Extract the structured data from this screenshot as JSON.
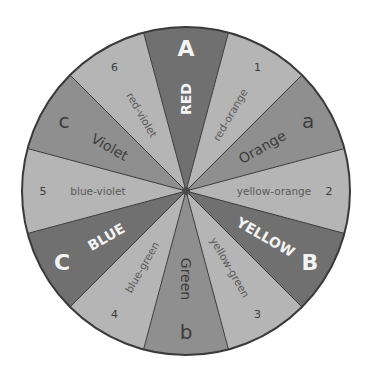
{
  "diagram": {
    "center": [
      186,
      191
    ],
    "radius": 164,
    "colors": {
      "primary": "#707070",
      "secondary": "#8f8f8f",
      "tertiary": "#b5b5b5",
      "outline": "#3a3a3a",
      "text_dark": "#3c3c3c",
      "text_light": "#f4f4f4",
      "text_tertiary": "#5a5a5a",
      "hub": "#4a4a4a"
    },
    "segments": [
      {
        "name": "RED",
        "type": "primary",
        "marker": "A",
        "center_angle": 0
      },
      {
        "name": "red-orange",
        "type": "tertiary",
        "marker": "1",
        "center_angle": 30
      },
      {
        "name": "Orange",
        "type": "secondary",
        "marker": "a",
        "center_angle": 60
      },
      {
        "name": "yellow-orange",
        "type": "tertiary",
        "marker": "2",
        "center_angle": 90
      },
      {
        "name": "YELLOW",
        "type": "primary",
        "marker": "B",
        "center_angle": 120
      },
      {
        "name": "yellow-green",
        "type": "tertiary",
        "marker": "3",
        "center_angle": 150
      },
      {
        "name": "Green",
        "type": "secondary",
        "marker": "b",
        "center_angle": 180
      },
      {
        "name": "blue-green",
        "type": "tertiary",
        "marker": "4",
        "center_angle": 210
      },
      {
        "name": "BLUE",
        "type": "primary",
        "marker": "C",
        "center_angle": 240
      },
      {
        "name": "blue-violet",
        "type": "tertiary",
        "marker": "5",
        "center_angle": 270
      },
      {
        "name": "Violet",
        "type": "secondary",
        "marker": "c",
        "center_angle": 300
      },
      {
        "name": "red-violet",
        "type": "tertiary",
        "marker": "6",
        "center_angle": 330
      }
    ]
  }
}
